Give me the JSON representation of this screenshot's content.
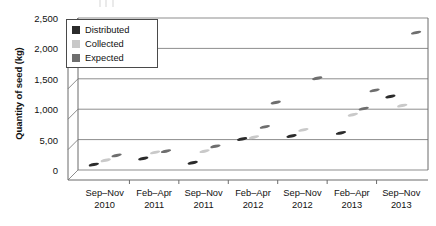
{
  "chart_data": {
    "type": "scatter",
    "title": "",
    "xlabel": "",
    "ylabel": "Quantity of seed (kg)",
    "ylim": [
      0,
      2500
    ],
    "ytick_values": [
      0,
      500,
      1000,
      1500,
      2000,
      2500
    ],
    "ytick_labels": [
      "0",
      "5,00",
      "1,000",
      "1,500",
      "2,000",
      "2,500"
    ],
    "grid": "horizontal",
    "legend_position": "top-left-inside",
    "categories": [
      "Sep–Nov\n2010",
      "Feb–Apr\n2011",
      "Sep–Nov\n2011",
      "Feb–Apr\n2012",
      "Sep–Nov\n2012",
      "Feb–Apr\n2013",
      "Sep–Nov\n2013"
    ],
    "category_lines": [
      [
        "Sep–Nov",
        "2010"
      ],
      [
        "Feb–Apr",
        "2011"
      ],
      [
        "Sep–Nov",
        "2011"
      ],
      [
        "Feb–Apr",
        "2012"
      ],
      [
        "Sep–Nov",
        "2012"
      ],
      [
        "Feb–Apr",
        "2013"
      ],
      [
        "Sep–Nov",
        "2013"
      ]
    ],
    "series": [
      {
        "name": "Distributed",
        "color": "#2b2b2b",
        "points": [
          {
            "category": 0,
            "offset": -0.22,
            "value": 180
          },
          {
            "category": 1,
            "offset": -0.22,
            "value": 280
          },
          {
            "category": 2,
            "offset": -0.22,
            "value": 210
          },
          {
            "category": 3,
            "offset": -0.22,
            "value": 600
          },
          {
            "category": 4,
            "offset": -0.22,
            "value": 650
          },
          {
            "category": 5,
            "offset": -0.22,
            "value": 700
          },
          {
            "category": 6,
            "offset": -0.22,
            "value": 1300
          }
        ]
      },
      {
        "name": "Collected",
        "color": "#c9c9c9",
        "points": [
          {
            "category": 0,
            "offset": 0.02,
            "value": 250
          },
          {
            "category": 1,
            "offset": 0.02,
            "value": 380
          },
          {
            "category": 2,
            "offset": 0.02,
            "value": 400
          },
          {
            "category": 3,
            "offset": 0.02,
            "value": 630
          },
          {
            "category": 4,
            "offset": 0.02,
            "value": 750
          },
          {
            "category": 5,
            "offset": 0.02,
            "value": 1000
          },
          {
            "category": 6,
            "offset": 0.02,
            "value": 1150
          }
        ]
      },
      {
        "name": "Expected",
        "color": "#6e6e6e",
        "points": [
          {
            "category": 0,
            "offset": 0.24,
            "value": 330
          },
          {
            "category": 1,
            "offset": 0.24,
            "value": 400
          },
          {
            "category": 2,
            "offset": 0.24,
            "value": 480
          },
          {
            "category": 3,
            "offset": 0.24,
            "value": 800
          },
          {
            "category": 3,
            "offset": 0.46,
            "value": 1200
          },
          {
            "category": 4,
            "offset": 0.3,
            "value": 1600
          },
          {
            "category": 5,
            "offset": 0.24,
            "value": 1100
          },
          {
            "category": 5,
            "offset": 0.46,
            "value": 1400
          },
          {
            "category": 6,
            "offset": 0.3,
            "value": 2350
          }
        ]
      }
    ]
  },
  "legend": {
    "items": [
      {
        "label": "Distributed",
        "color": "#2b2b2b"
      },
      {
        "label": "Collected",
        "color": "#c9c9c9"
      },
      {
        "label": "Expected",
        "color": "#6e6e6e"
      }
    ]
  },
  "axis": {
    "y_title": "Quantity of seed (kg)"
  },
  "style": {
    "frame_color": "#6b6b6b",
    "gridline_color": "#8d8d8d",
    "text_color": "#111111",
    "background": "#ffffff"
  }
}
